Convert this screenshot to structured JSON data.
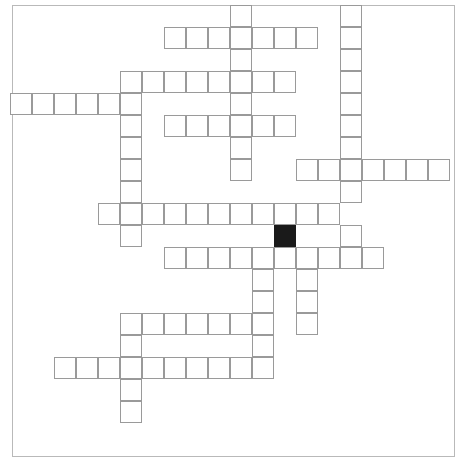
{
  "puzzle": {
    "title": "Crossword Puzzle Grid",
    "type": "crossword",
    "grid": {
      "columns": 20,
      "rows": 20,
      "cell_size": 22,
      "origin_x": 10,
      "origin_y": 5,
      "cell_border_color": "#9a9a9a",
      "blocked_cell_color": "#1a1a1a",
      "background_color": "#ffffff",
      "frame_color": "#b9b9b9"
    },
    "frame": {
      "x": 12,
      "y": 5,
      "width": 443,
      "height": 452
    },
    "counts": {
      "open_cells": 116,
      "blocked_cells": 1,
      "across_entries": 11,
      "down_entries": 9
    },
    "blocked_cells": [
      {
        "col": 12,
        "row": 10
      }
    ],
    "entries": {
      "across": [
        {
          "id": "a1",
          "row": 1,
          "col_start": 7,
          "length": 7
        },
        {
          "id": "a2",
          "row": 3,
          "col_start": 5,
          "length": 8
        },
        {
          "id": "a3",
          "row": 4,
          "col_start": 0,
          "length": 6
        },
        {
          "id": "a4",
          "row": 5,
          "col_start": 7,
          "length": 6
        },
        {
          "id": "a5",
          "row": 7,
          "col_start": 13,
          "length": 7
        },
        {
          "id": "a6",
          "row": 9,
          "col_start": 4,
          "length": 11
        },
        {
          "id": "a7",
          "row": 11,
          "col_start": 7,
          "length": 10
        },
        {
          "id": "a8",
          "row": 14,
          "col_start": 5,
          "length": 11
        },
        {
          "id": "a9",
          "row": 16,
          "col_start": 2,
          "length": 11
        }
      ],
      "down": [
        {
          "id": "d1",
          "col": 10,
          "row_start": 0,
          "length": 8
        },
        {
          "id": "d2",
          "col": 15,
          "row_start": 0,
          "length": 9
        },
        {
          "id": "d3",
          "col": 5,
          "row_start": 3,
          "length": 9
        },
        {
          "id": "d4",
          "col": 12,
          "row_start": 3,
          "length": 3
        },
        {
          "id": "d5",
          "col": 11,
          "row_start": 11,
          "length": 5
        },
        {
          "id": "d6",
          "col": 15,
          "row_start": 11,
          "length": 4
        },
        {
          "id": "d7",
          "col": 5,
          "row_start": 14,
          "length": 5
        }
      ]
    },
    "cells": [
      {
        "col": 10,
        "row": 0
      },
      {
        "col": 15,
        "row": 0
      },
      {
        "col": 7,
        "row": 1
      },
      {
        "col": 8,
        "row": 1
      },
      {
        "col": 9,
        "row": 1
      },
      {
        "col": 10,
        "row": 1
      },
      {
        "col": 11,
        "row": 1
      },
      {
        "col": 12,
        "row": 1
      },
      {
        "col": 13,
        "row": 1
      },
      {
        "col": 15,
        "row": 1
      },
      {
        "col": 10,
        "row": 2
      },
      {
        "col": 15,
        "row": 2
      },
      {
        "col": 5,
        "row": 3
      },
      {
        "col": 6,
        "row": 3
      },
      {
        "col": 7,
        "row": 3
      },
      {
        "col": 8,
        "row": 3
      },
      {
        "col": 9,
        "row": 3
      },
      {
        "col": 10,
        "row": 3
      },
      {
        "col": 11,
        "row": 3
      },
      {
        "col": 12,
        "row": 3
      },
      {
        "col": 15,
        "row": 3
      },
      {
        "col": 0,
        "row": 4
      },
      {
        "col": 1,
        "row": 4
      },
      {
        "col": 2,
        "row": 4
      },
      {
        "col": 3,
        "row": 4
      },
      {
        "col": 4,
        "row": 4
      },
      {
        "col": 5,
        "row": 4
      },
      {
        "col": 10,
        "row": 4
      },
      {
        "col": 15,
        "row": 4
      },
      {
        "col": 5,
        "row": 5
      },
      {
        "col": 7,
        "row": 5
      },
      {
        "col": 8,
        "row": 5
      },
      {
        "col": 9,
        "row": 5
      },
      {
        "col": 10,
        "row": 5
      },
      {
        "col": 11,
        "row": 5
      },
      {
        "col": 12,
        "row": 5
      },
      {
        "col": 15,
        "row": 5
      },
      {
        "col": 5,
        "row": 6
      },
      {
        "col": 10,
        "row": 6
      },
      {
        "col": 15,
        "row": 6
      },
      {
        "col": 5,
        "row": 7
      },
      {
        "col": 10,
        "row": 7
      },
      {
        "col": 13,
        "row": 7
      },
      {
        "col": 14,
        "row": 7
      },
      {
        "col": 15,
        "row": 7
      },
      {
        "col": 16,
        "row": 7
      },
      {
        "col": 17,
        "row": 7
      },
      {
        "col": 18,
        "row": 7
      },
      {
        "col": 19,
        "row": 7
      },
      {
        "col": 5,
        "row": 8
      },
      {
        "col": 15,
        "row": 8
      },
      {
        "col": 4,
        "row": 9
      },
      {
        "col": 5,
        "row": 9
      },
      {
        "col": 6,
        "row": 9
      },
      {
        "col": 7,
        "row": 9
      },
      {
        "col": 8,
        "row": 9
      },
      {
        "col": 9,
        "row": 9
      },
      {
        "col": 10,
        "row": 9
      },
      {
        "col": 11,
        "row": 9
      },
      {
        "col": 12,
        "row": 9
      },
      {
        "col": 13,
        "row": 9
      },
      {
        "col": 14,
        "row": 9
      },
      {
        "col": 5,
        "row": 10
      },
      {
        "col": 12,
        "row": 10
      },
      {
        "col": 15,
        "row": 10
      },
      {
        "col": 7,
        "row": 11
      },
      {
        "col": 8,
        "row": 11
      },
      {
        "col": 9,
        "row": 11
      },
      {
        "col": 10,
        "row": 11
      },
      {
        "col": 11,
        "row": 11
      },
      {
        "col": 12,
        "row": 11
      },
      {
        "col": 13,
        "row": 11
      },
      {
        "col": 14,
        "row": 11
      },
      {
        "col": 15,
        "row": 11
      },
      {
        "col": 16,
        "row": 11
      },
      {
        "col": 11,
        "row": 12
      },
      {
        "col": 13,
        "row": 12
      },
      {
        "col": 11,
        "row": 13
      },
      {
        "col": 13,
        "row": 13
      },
      {
        "col": 5,
        "row": 14
      },
      {
        "col": 6,
        "row": 14
      },
      {
        "col": 7,
        "row": 14
      },
      {
        "col": 8,
        "row": 14
      },
      {
        "col": 9,
        "row": 14
      },
      {
        "col": 10,
        "row": 14
      },
      {
        "col": 11,
        "row": 14
      },
      {
        "col": 13,
        "row": 14
      },
      {
        "col": 5,
        "row": 15
      },
      {
        "col": 11,
        "row": 15
      },
      {
        "col": 2,
        "row": 16
      },
      {
        "col": 3,
        "row": 16
      },
      {
        "col": 4,
        "row": 16
      },
      {
        "col": 5,
        "row": 16
      },
      {
        "col": 6,
        "row": 16
      },
      {
        "col": 7,
        "row": 16
      },
      {
        "col": 8,
        "row": 16
      },
      {
        "col": 9,
        "row": 16
      },
      {
        "col": 10,
        "row": 16
      },
      {
        "col": 11,
        "row": 16
      },
      {
        "col": 5,
        "row": 17
      },
      {
        "col": 5,
        "row": 18
      }
    ]
  }
}
